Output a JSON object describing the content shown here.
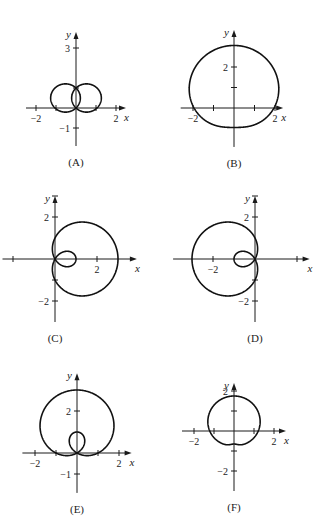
{
  "chart_data": [
    {
      "type": "line",
      "id": "A",
      "caption": "(A)",
      "polar": "r = sin(theta) + 0.8*(1 - |sin(theta)|)^... (heart, cusp at origin)",
      "origin": [
        76,
        108
      ],
      "scale": 20,
      "xrange": [
        -2.5,
        2.5
      ],
      "yrange": [
        -1.9,
        3.8
      ],
      "xticks": [
        {
          "v": -2,
          "l": "−2"
        },
        {
          "v": -1,
          "l": ""
        },
        {
          "v": 1,
          "l": ""
        },
        {
          "v": 2,
          "l": "2"
        }
      ],
      "yticks": [
        {
          "v": 3,
          "l": "3"
        },
        {
          "v": 1,
          "l": ""
        },
        {
          "v": -1,
          "l": "−1"
        }
      ],
      "xlabel": "x",
      "ylabel": "y",
      "curve": "A"
    },
    {
      "type": "line",
      "id": "B",
      "caption": "(B)",
      "polar": "r = 2 + sin(theta)",
      "origin": [
        234,
        108
      ],
      "scale": 20.5,
      "xrange": [
        -2.6,
        2.4
      ],
      "yrange": [
        -1.9,
        3.8
      ],
      "xticks": [
        {
          "v": -2,
          "l": "−2"
        },
        {
          "v": -1,
          "l": ""
        },
        {
          "v": 1,
          "l": ""
        },
        {
          "v": 2,
          "l": "2"
        }
      ],
      "yticks": [
        {
          "v": 2,
          "l": "2"
        },
        {
          "v": 1,
          "l": ""
        }
      ],
      "xlabel": "x",
      "ylabel": "y",
      "curve": "B"
    },
    {
      "type": "line",
      "id": "C",
      "caption": "(C)",
      "polar": "r = 1 + 2cos(theta)",
      "origin": [
        55,
        259
      ],
      "scale": 21,
      "xrange": [
        -2.5,
        3.9
      ],
      "yrange": [
        -3.0,
        3.0
      ],
      "xticks": [
        {
          "v": -2,
          "l": ""
        },
        {
          "v": 2,
          "l": "2"
        }
      ],
      "yticks": [
        {
          "v": 3,
          "l": ""
        },
        {
          "v": 2,
          "l": "2"
        },
        {
          "v": -1,
          "l": ""
        },
        {
          "v": -2,
          "l": "−2"
        }
      ],
      "xlabel": "x",
      "ylabel": "y",
      "curve": "C"
    },
    {
      "type": "line",
      "id": "D",
      "caption": "(D)",
      "polar": "r = 1 − 2cos(theta)",
      "origin": [
        255,
        259
      ],
      "scale": 21,
      "xrange": [
        -3.9,
        2.6
      ],
      "yrange": [
        -3.0,
        3.0
      ],
      "xticks": [
        {
          "v": -2,
          "l": "−2"
        },
        {
          "v": 2,
          "l": ""
        }
      ],
      "yticks": [
        {
          "v": 3,
          "l": ""
        },
        {
          "v": 2,
          "l": "2"
        },
        {
          "v": -1,
          "l": ""
        },
        {
          "v": -2,
          "l": "−2"
        }
      ],
      "xlabel": "x",
      "ylabel": "y",
      "curve": "D"
    },
    {
      "type": "line",
      "id": "E",
      "caption": "(E)",
      "polar": "r = 1 + 2sin(theta)",
      "origin": [
        77,
        453
      ],
      "scale": 21,
      "xrange": [
        -2.6,
        2.6
      ],
      "yrange": [
        -1.9,
        3.8
      ],
      "xticks": [
        {
          "v": -2,
          "l": "−2"
        },
        {
          "v": -1,
          "l": ""
        },
        {
          "v": 1,
          "l": ""
        },
        {
          "v": 2,
          "l": "2"
        }
      ],
      "yticks": [
        {
          "v": 2,
          "l": "2"
        },
        {
          "v": -1,
          "l": "−1"
        }
      ],
      "xlabel": "x",
      "ylabel": "y",
      "curve": "E"
    },
    {
      "type": "line",
      "id": "F",
      "caption": "(F)",
      "polar": "r = 1.3 + 0.3sin(theta) (dimpled)",
      "origin": [
        234,
        431
      ],
      "scale": 20,
      "xrange": [
        -2.6,
        2.6
      ],
      "yrange": [
        -3.0,
        2.4
      ],
      "xticks": [
        {
          "v": -2,
          "l": "−2"
        },
        {
          "v": -1,
          "l": ""
        },
        {
          "v": 1,
          "l": ""
        },
        {
          "v": 2,
          "l": "2"
        }
      ],
      "yticks": [
        {
          "v": 2,
          "l": "2"
        },
        {
          "v": 1,
          "l": ""
        },
        {
          "v": -1,
          "l": ""
        },
        {
          "v": -2,
          "l": "−2"
        }
      ],
      "xlabel": "x",
      "ylabel": "y",
      "curve": "F"
    }
  ]
}
